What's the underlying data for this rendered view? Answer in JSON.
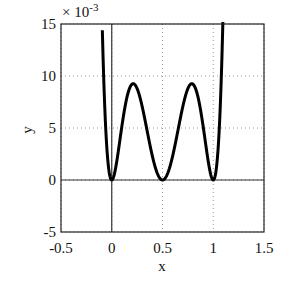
{
  "chart_data": {
    "type": "line",
    "title": "",
    "xlabel": "x",
    "ylabel": "y",
    "y_multiplier": "× 10",
    "y_multiplier_exp": "-3",
    "xlim": [
      -0.5,
      1.5
    ],
    "ylim": [
      -5,
      15
    ],
    "y_scale_factor": 0.001,
    "grid": "dotted",
    "xticks": [
      "-0.5",
      "0",
      "0.5",
      "1",
      "1.5"
    ],
    "yticks": [
      "-5",
      "0",
      "5",
      "10",
      "15"
    ],
    "series": [
      {
        "name": "y = [x(2x-1)(x-1)]^2",
        "x": [
          -0.1,
          -0.05,
          0,
          0.05,
          0.1,
          0.15,
          0.2,
          0.21,
          0.25,
          0.3,
          0.35,
          0.4,
          0.45,
          0.5,
          0.55,
          0.6,
          0.65,
          0.7,
          0.75,
          0.79,
          0.8,
          0.85,
          0.9,
          0.95,
          1.0,
          1.05,
          1.1
        ],
        "y": [
          58.08,
          11.99,
          0,
          1.84,
          5.18,
          8.12,
          9.22,
          9.25,
          8.79,
          7.06,
          4.67,
          2.3,
          0.65,
          0,
          0.65,
          2.3,
          4.67,
          7.06,
          8.79,
          9.25,
          9.22,
          8.12,
          5.18,
          1.84,
          0,
          11.99,
          58.08
        ]
      }
    ],
    "reference_lines": {
      "x0": 0,
      "y0": 0
    }
  }
}
